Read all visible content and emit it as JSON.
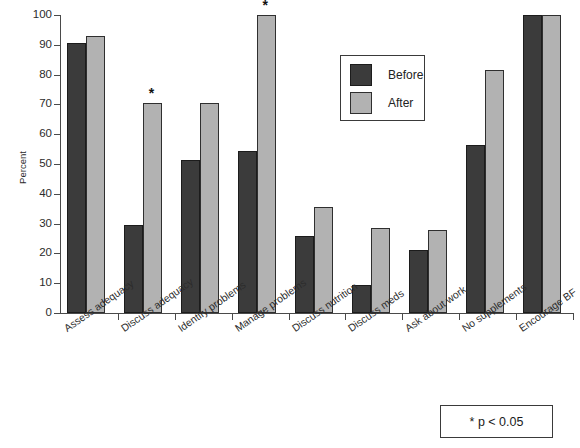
{
  "chart_data": {
    "type": "bar",
    "title": "",
    "xlabel": "",
    "ylabel": "Percent",
    "ylim": [
      0,
      100
    ],
    "ytick_step": 10,
    "yticks": [
      0,
      10,
      20,
      30,
      40,
      50,
      60,
      70,
      80,
      90,
      100
    ],
    "grid": false,
    "legend_position": "upper-center-right",
    "categories": [
      "Assess adequacy",
      "Discuss adequacy",
      "Identify problems",
      "Manage problems",
      "Discuss nutrition",
      "Discuss meds",
      "Ask about work",
      "No supplements",
      "Encourage BF"
    ],
    "series": [
      {
        "name": "Before",
        "color": "#3b3b3b",
        "values": [
          90.5,
          29.5,
          51.5,
          54.5,
          26.0,
          9.5,
          21.0,
          56.5,
          100.0
        ]
      },
      {
        "name": "After",
        "color": "#b2b2b2",
        "values": [
          93.0,
          70.5,
          70.5,
          100.0,
          35.5,
          28.5,
          28.0,
          81.5,
          100.0
        ]
      }
    ],
    "annotations": [
      {
        "symbol": "*",
        "category": "Discuss adequacy",
        "series": "After"
      },
      {
        "symbol": "*",
        "category": "Manage problems",
        "series": "After"
      }
    ]
  },
  "legend": {
    "items": [
      {
        "label": "Before",
        "swatch": "before"
      },
      {
        "label": "After",
        "swatch": "after"
      }
    ]
  },
  "footnote": {
    "text": "* p < 0.05"
  }
}
